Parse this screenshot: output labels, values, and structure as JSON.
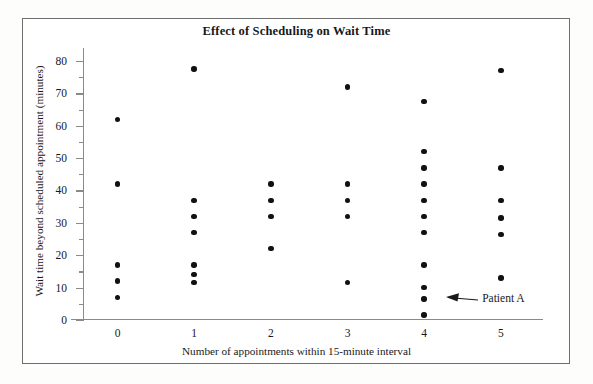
{
  "chart_data": {
    "type": "scatter",
    "title": "Effect of Scheduling on Wait Time",
    "xlabel": "Number of appointments within 15-minute interval",
    "ylabel": "Wait time beyond scheduled appointment (minutes)",
    "xlim": [
      -0.45,
      5.55
    ],
    "ylim": [
      0,
      84
    ],
    "xticks": [
      0,
      1,
      2,
      3,
      4,
      5
    ],
    "xtick_labels": [
      "0",
      "1",
      "2",
      "3",
      "4",
      "5"
    ],
    "yticks": [
      0,
      10,
      20,
      30,
      40,
      50,
      60,
      70,
      80
    ],
    "ytick_labels": [
      "0",
      "10",
      "20",
      "30",
      "40",
      "50",
      "60",
      "70",
      "80"
    ],
    "yticks_minor": [
      5,
      15,
      25,
      35,
      45,
      55,
      65,
      75
    ],
    "grid": false,
    "legend": null,
    "points": [
      {
        "x": 0,
        "y": 62
      },
      {
        "x": 0,
        "y": 42
      },
      {
        "x": 0,
        "y": 17
      },
      {
        "x": 0,
        "y": 12
      },
      {
        "x": 0,
        "y": 7
      },
      {
        "x": 1,
        "y": 77.5
      },
      {
        "x": 1,
        "y": 37
      },
      {
        "x": 1,
        "y": 32
      },
      {
        "x": 1,
        "y": 27
      },
      {
        "x": 1,
        "y": 17
      },
      {
        "x": 1,
        "y": 14
      },
      {
        "x": 1,
        "y": 11.5
      },
      {
        "x": 2,
        "y": 42
      },
      {
        "x": 2,
        "y": 37
      },
      {
        "x": 2,
        "y": 32
      },
      {
        "x": 2,
        "y": 22
      },
      {
        "x": 3,
        "y": 72
      },
      {
        "x": 3,
        "y": 42
      },
      {
        "x": 3,
        "y": 37
      },
      {
        "x": 3,
        "y": 32
      },
      {
        "x": 3,
        "y": 11.5
      },
      {
        "x": 4,
        "y": 67.5
      },
      {
        "x": 4,
        "y": 52
      },
      {
        "x": 4,
        "y": 47
      },
      {
        "x": 4,
        "y": 42
      },
      {
        "x": 4,
        "y": 37
      },
      {
        "x": 4,
        "y": 32
      },
      {
        "x": 4,
        "y": 27
      },
      {
        "x": 4,
        "y": 17
      },
      {
        "x": 4,
        "y": 10
      },
      {
        "x": 4,
        "y": 6.5
      },
      {
        "x": 4,
        "y": 1.5
      },
      {
        "x": 5,
        "y": 77
      },
      {
        "x": 5,
        "y": 47
      },
      {
        "x": 5,
        "y": 37
      },
      {
        "x": 5,
        "y": 31.5
      },
      {
        "x": 5,
        "y": 26.5
      },
      {
        "x": 5,
        "y": 13
      }
    ],
    "annotations": [
      {
        "label": "Patient A",
        "target_x": 4,
        "target_y": 6.5
      }
    ],
    "marker_color": "#111111"
  }
}
